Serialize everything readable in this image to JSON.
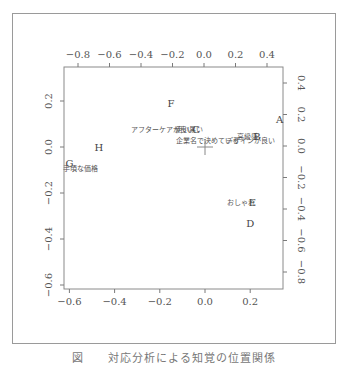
{
  "caption": "図　　対応分析による知覚の位置関係",
  "chart_data": {
    "type": "scatter",
    "title": "",
    "subtitle": "Correspondence analysis biplot (brands A–H and perception attributes)",
    "grid": false,
    "axes": {
      "bottom": {
        "ticks": [
          -0.6,
          -0.4,
          -0.2,
          0.0,
          0.2
        ],
        "labels": [
          "-0.6",
          "-0.4",
          "-0.2",
          "0.0",
          "0.2"
        ],
        "range": [
          -0.62,
          0.35
        ]
      },
      "left": {
        "ticks": [
          0.2,
          0.0,
          -0.2,
          -0.4,
          -0.6
        ],
        "labels": [
          "0.2",
          "0.0",
          "-0.2",
          "-0.4",
          "-0.6"
        ],
        "range": [
          -0.6,
          0.35
        ]
      },
      "top": {
        "ticks": [
          -0.8,
          -0.6,
          -0.4,
          -0.2,
          0.0,
          0.2,
          0.4
        ],
        "labels": [
          "-0.8",
          "-0.6",
          "-0.4",
          "-0.2",
          "0.0",
          "0.2",
          "0.4"
        ]
      },
      "right": {
        "ticks": [
          0.4,
          0.2,
          0.0,
          -0.2,
          -0.4,
          -0.6,
          -0.8
        ],
        "labels": [
          "0.4",
          "0.2",
          "0.0",
          "-0.2",
          "-0.4",
          "-0.6",
          "-0.8"
        ]
      }
    },
    "series": [
      {
        "name": "brands",
        "axes": "bottom-left",
        "points": [
          {
            "label": "A",
            "x": 0.33,
            "y": 0.12
          },
          {
            "label": "B",
            "x": 0.23,
            "y": 0.05
          },
          {
            "label": "C",
            "x": -0.04,
            "y": 0.08
          },
          {
            "label": "D",
            "x": 0.2,
            "y": -0.33
          },
          {
            "label": "E",
            "x": 0.21,
            "y": -0.24
          },
          {
            "label": "F",
            "x": -0.15,
            "y": 0.19
          },
          {
            "label": "G",
            "x": -0.6,
            "y": -0.07
          },
          {
            "label": "H",
            "x": -0.47,
            "y": 0.0
          }
        ]
      },
      {
        "name": "attributes",
        "axes": "bottom-left",
        "points": [
          {
            "label": "アフターケアが良い",
            "x": -0.19,
            "y": 0.08
          },
          {
            "label": "使い易い",
            "x": -0.07,
            "y": 0.08
          },
          {
            "label": "企業名で決めている",
            "x": 0.01,
            "y": 0.03
          },
          {
            "label": "デザインが良い",
            "x": 0.2,
            "y": 0.03
          },
          {
            "label": "高級感",
            "x": 0.19,
            "y": 0.05
          },
          {
            "label": "おしゃれ",
            "x": 0.16,
            "y": -0.24
          },
          {
            "label": "手頃な価格",
            "x": -0.55,
            "y": -0.09
          }
        ]
      }
    ],
    "annotations": [
      "origin cross marker at (0,0)"
    ],
    "caption": "図　　対応分析による知覚の位置関係"
  }
}
